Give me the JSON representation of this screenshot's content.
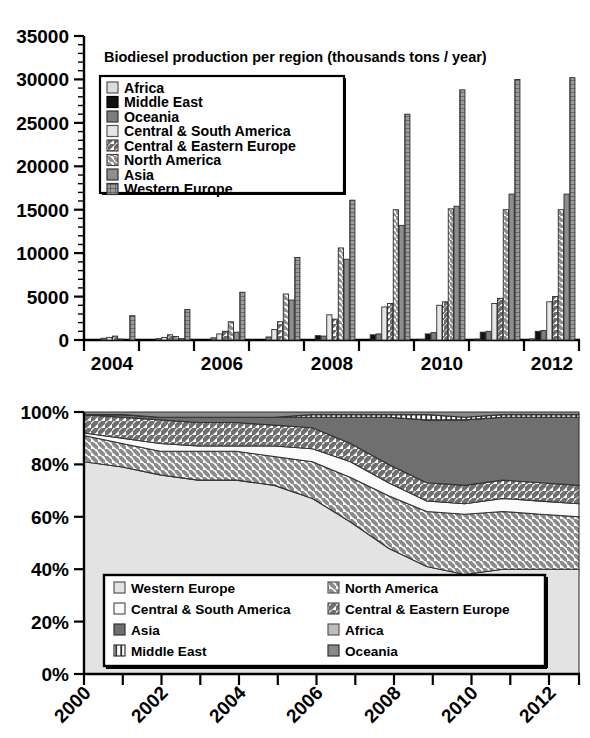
{
  "bar_chart": {
    "title": "Biodiesel production per region (thousands tons / year)",
    "y_ticks": [
      "0",
      "5000",
      "10000",
      "15000",
      "20000",
      "25000",
      "30000",
      "35000"
    ],
    "x_ticks": [
      "2004",
      "2006",
      "2008",
      "2010",
      "2012"
    ],
    "legend": [
      {
        "label": "Africa",
        "pattern": "light-solid"
      },
      {
        "label": "Middle East",
        "pattern": "black"
      },
      {
        "label": "Oceania",
        "pattern": "dark-solid"
      },
      {
        "label": "Central & South America",
        "pattern": "pale-solid"
      },
      {
        "label": "Central & Eastern Europe",
        "pattern": "diag-up"
      },
      {
        "label": "North America",
        "pattern": "diag-down"
      },
      {
        "label": "Asia",
        "pattern": "mid-solid"
      },
      {
        "label": "Western Europe",
        "pattern": "grid"
      }
    ]
  },
  "area_chart": {
    "y_ticks": [
      "0%",
      "20%",
      "40%",
      "60%",
      "80%",
      "100%"
    ],
    "x_ticks": [
      "2000",
      "2002",
      "2004",
      "2006",
      "2008",
      "2010",
      "2012"
    ],
    "legend": [
      {
        "label": "Western Europe",
        "pattern": "pale-solid"
      },
      {
        "label": "North America",
        "pattern": "diag-down"
      },
      {
        "label": "Central & South America",
        "pattern": "white-solid"
      },
      {
        "label": "Central & Eastern Europe",
        "pattern": "diag-up"
      },
      {
        "label": "Asia",
        "pattern": "dark-solid"
      },
      {
        "label": "Africa",
        "pattern": "mid-solid"
      },
      {
        "label": "Middle East",
        "pattern": "vert-lines"
      },
      {
        "label": "Oceania",
        "pattern": "mid-dark-solid"
      }
    ]
  },
  "colors": {
    "black": "#111111",
    "dark": "#6e6e6e",
    "mid": "#8a8a8a",
    "light": "#c9c9c9",
    "pale": "#e2e2e2",
    "white": "#f7f7f7",
    "axis": "#000000"
  },
  "chart_data": [
    {
      "type": "bar",
      "title": "Biodiesel production per region (thousands tons / year)",
      "xlabel": "",
      "ylabel": "thousands tons / year",
      "ylim": [
        0,
        35000
      ],
      "ytick_interval": 5000,
      "grid": false,
      "legend_position": "inside-top-left",
      "categories": [
        "2004",
        "2005",
        "2006",
        "2007",
        "2008",
        "2009",
        "2010",
        "2011",
        "2012"
      ],
      "series": [
        {
          "name": "Africa",
          "values": [
            0,
            0,
            20,
            30,
            50,
            60,
            80,
            100,
            120
          ]
        },
        {
          "name": "Middle East",
          "values": [
            0,
            0,
            10,
            20,
            500,
            600,
            700,
            900,
            1000
          ]
        },
        {
          "name": "Oceania",
          "values": [
            200,
            150,
            250,
            350,
            450,
            700,
            850,
            1000,
            1100
          ]
        },
        {
          "name": "Central & South America",
          "values": [
            300,
            300,
            700,
            1200,
            2900,
            3800,
            4000,
            4200,
            4400
          ]
        },
        {
          "name": "Central & Eastern Europe",
          "values": [
            450,
            600,
            1000,
            2100,
            2400,
            4200,
            4400,
            4800,
            5000
          ]
        },
        {
          "name": "North America",
          "values": [
            100,
            400,
            2100,
            5300,
            10600,
            15000,
            15100,
            15000,
            15000
          ]
        },
        {
          "name": "Asia",
          "values": [
            60,
            150,
            900,
            4600,
            9300,
            13200,
            15400,
            16800,
            16800
          ]
        },
        {
          "name": "Western Europe",
          "values": [
            2800,
            3500,
            5500,
            9500,
            16100,
            26000,
            28800,
            30000,
            30200
          ]
        }
      ]
    },
    {
      "type": "area",
      "title": "",
      "xlabel": "",
      "ylabel": "share of production",
      "ylim": [
        0,
        100
      ],
      "ytick_interval": 20,
      "stacked": true,
      "normalized": true,
      "grid": false,
      "legend_position": "inside-bottom",
      "x": [
        2000,
        2001,
        2002,
        2003,
        2004,
        2005,
        2006,
        2007,
        2008,
        2009,
        2010,
        2011,
        2012,
        2013
      ],
      "series": [
        {
          "name": "Western Europe",
          "values": [
            81,
            79,
            76,
            74,
            74,
            72,
            67,
            58,
            48,
            41,
            38,
            40,
            40,
            40
          ]
        },
        {
          "name": "North America",
          "values": [
            10,
            9,
            9,
            11,
            11,
            11,
            14,
            17,
            20,
            21,
            23,
            22,
            21,
            20
          ]
        },
        {
          "name": "Central & South America",
          "values": [
            1,
            2,
            3,
            2,
            2,
            4,
            5,
            6,
            5,
            4,
            4,
            5,
            5,
            5
          ]
        },
        {
          "name": "Central & Eastern Europe",
          "values": [
            7,
            8,
            9,
            9,
            9,
            8,
            8,
            7,
            7,
            7,
            7,
            7,
            7,
            7
          ]
        },
        {
          "name": "Asia",
          "values": [
            0,
            1,
            1,
            2,
            2,
            3,
            4,
            10,
            18,
            24,
            25,
            24,
            25,
            26
          ]
        },
        {
          "name": "Africa",
          "values": [
            0,
            0,
            0,
            0,
            0,
            0,
            0,
            0,
            0,
            0,
            0,
            0,
            0,
            0
          ]
        },
        {
          "name": "Middle East",
          "values": [
            0,
            0,
            0,
            0,
            0,
            0,
            1,
            1,
            1,
            2,
            1,
            1,
            1,
            1
          ]
        },
        {
          "name": "Oceania",
          "values": [
            1,
            1,
            2,
            2,
            2,
            2,
            1,
            1,
            1,
            1,
            2,
            1,
            1,
            1
          ]
        }
      ]
    }
  ]
}
